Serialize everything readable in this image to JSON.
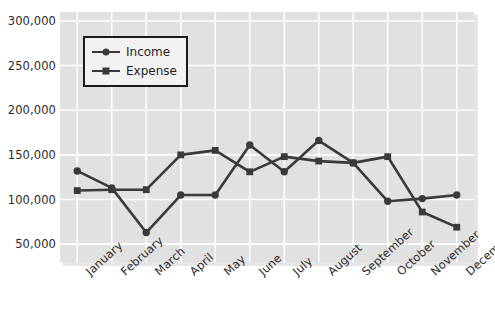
{
  "chart_data": {
    "type": "line",
    "title": "",
    "xlabel": "",
    "ylabel": "",
    "categories": [
      "January",
      "February",
      "March",
      "April",
      "May",
      "June",
      "July",
      "August",
      "September",
      "October",
      "November",
      "December"
    ],
    "series": [
      {
        "name": "Income",
        "marker": "circle",
        "color": "#3a3a3a",
        "values": [
          132000,
          113000,
          63000,
          105000,
          105000,
          161000,
          131000,
          166000,
          141000,
          98000,
          101000,
          105000
        ]
      },
      {
        "name": "Expense",
        "marker": "square",
        "color": "#3a3a3a",
        "values": [
          110000,
          111000,
          111000,
          150000,
          155000,
          131000,
          148000,
          143000,
          141000,
          148000,
          86000,
          69000
        ]
      }
    ],
    "series_render": [
      {
        "name": "Income",
        "marker": "circle",
        "values": [
          132000,
          113000,
          63000,
          105000,
          105000,
          161000,
          131000,
          166000,
          141000,
          98000,
          101000,
          105000
        ]
      },
      {
        "name": "Expense",
        "marker": "square",
        "values": [
          110000,
          111000,
          111000,
          150000,
          155000,
          131000,
          148000,
          143000,
          141000,
          148000,
          86000,
          69000
        ]
      }
    ],
    "yticks": [
      50000,
      100000,
      150000,
      200000,
      250000,
      300000
    ],
    "ytick_labels": [
      "50,000",
      "100,000",
      "150,000",
      "200,000",
      "250,000",
      "300,000"
    ],
    "ylim": [
      30000,
      310000
    ],
    "grid": true,
    "legend_position": "upper left",
    "legend_entries": [
      "Income",
      "Expense"
    ],
    "plot_background": "#e1e1e1",
    "grid_color": "#ffffff",
    "figure_background": "#ffffff"
  }
}
